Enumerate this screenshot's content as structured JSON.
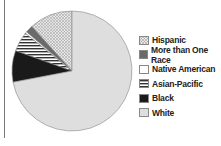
{
  "chart_data": {
    "type": "pie",
    "title": "",
    "categories": [
      "Hispanic",
      "More than One Race",
      "Native American",
      "Asian-Pacific",
      "Black",
      "White"
    ],
    "values": [
      11.7,
      2.0,
      0.5,
      5.3,
      8.5,
      72.0
    ],
    "colors": [
      "#d8d8d8",
      "#6a6a6a",
      "#ffffff",
      "#eeeeee",
      "#1a1a1a",
      "#dedede"
    ],
    "patterns": [
      "crosshatch",
      "solid",
      "solid",
      "horizontal-stripes",
      "solid",
      "solid"
    ],
    "legend_position": "right",
    "start_angle_deg": 0,
    "direction": "counterclockwise"
  },
  "legend": {
    "items": [
      {
        "label": "Hispanic"
      },
      {
        "label": "More than One Race"
      },
      {
        "label": "Native American"
      },
      {
        "label": "Asian-Pacific"
      },
      {
        "label": "Black"
      },
      {
        "label": "White"
      }
    ]
  }
}
